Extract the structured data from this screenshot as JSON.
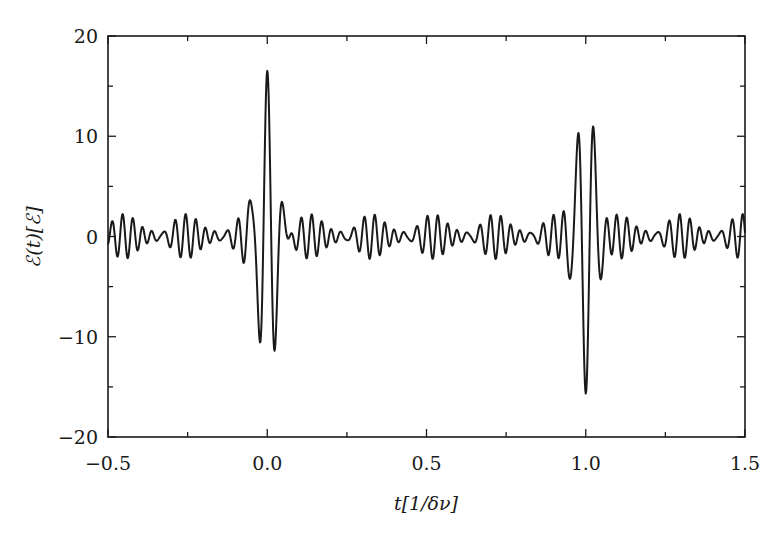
{
  "chart_data": {
    "type": "line",
    "title": "",
    "xlabel": "t[1/δν]",
    "ylabel": "ℰ(t)[ℰ]",
    "xlim": [
      -0.5,
      1.5
    ],
    "ylim": [
      -20,
      20
    ],
    "grid": false,
    "legend": null,
    "x_ticks": [
      -0.5,
      0.0,
      0.5,
      1.0,
      1.5
    ],
    "x_tick_labels": [
      "−0.5",
      "0.0",
      "0.5",
      "1.0",
      "1.5"
    ],
    "x_minor_ticks": [
      -0.25,
      0.25,
      0.75,
      1.25
    ],
    "y_ticks": [
      -20,
      -10,
      0,
      10,
      20
    ],
    "y_tick_labels": [
      "−20",
      "−10",
      "0",
      "10",
      "20"
    ],
    "y_minor_ticks": [
      -15,
      -5,
      5,
      15
    ],
    "series": [
      {
        "name": "field",
        "color": "#1a1a1a",
        "description": "Background oscillation of amplitude ~±2 with two wave packets",
        "background_amplitude": 2.0,
        "background_period": 0.033,
        "packets": [
          {
            "center": 0.0,
            "peak_max": 16.3,
            "trough_min": -14.0,
            "side_peaks": [
              9.0,
              8.6
            ]
          },
          {
            "center": 1.0,
            "peak_max": 14.5,
            "trough_min": -15.6,
            "side_peaks": [
              14.5,
              14.3
            ]
          }
        ],
        "key_points": [
          {
            "x": -0.05,
            "y": 9.0
          },
          {
            "x": -0.025,
            "y": -14.0
          },
          {
            "x": 0.0,
            "y": 16.3
          },
          {
            "x": 0.025,
            "y": -14.0
          },
          {
            "x": 0.05,
            "y": 8.6
          },
          {
            "x": 0.95,
            "y": -8.8
          },
          {
            "x": 0.975,
            "y": 14.5
          },
          {
            "x": 1.0,
            "y": -15.6
          },
          {
            "x": 1.025,
            "y": 14.3
          },
          {
            "x": 1.05,
            "y": -8.5
          }
        ]
      }
    ]
  }
}
